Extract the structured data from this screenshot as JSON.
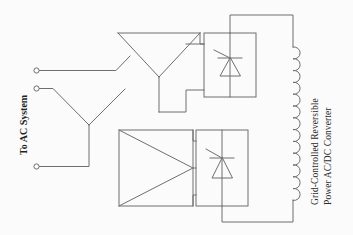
{
  "figure": {
    "background_color": "#fbfbfb",
    "line_color": "#6e6e6e",
    "text_color": "#2b2b2b"
  },
  "labels": {
    "ac_system": "To AC System",
    "converter_line1": "Grid-Controlled Reversible",
    "converter_line2": "Power AC/DC Converter"
  },
  "components": {
    "ac_terminals": [
      {
        "name": "ac-terminal-phase-a",
        "cx": 36.5,
        "cy": 70.5,
        "r": 2.6
      },
      {
        "name": "ac-terminal-phase-b",
        "cx": 36.5,
        "cy": 88.5,
        "r": 2.6
      },
      {
        "name": "ac-terminal-phase-c",
        "cx": 36.5,
        "cy": 166.5,
        "r": 2.6
      }
    ],
    "wye_source": {
      "name": "ac-wye-connection",
      "neutral_x": 89,
      "neutral_y": 125
    },
    "upper_transformer": {
      "name": "wye-winding-transformer",
      "type": "wye",
      "x": 118,
      "y": 33,
      "width": 82,
      "height": 55
    },
    "lower_transformer": {
      "name": "delta-winding-transformer",
      "type": "delta",
      "x": 119,
      "y": 130,
      "width": 74,
      "height": 76
    },
    "upper_converter": {
      "name": "upper-thyristor-bridge",
      "x": 204,
      "y": 33,
      "width": 52,
      "height": 64,
      "device": "thyristor"
    },
    "lower_converter": {
      "name": "lower-thyristor-bridge",
      "x": 196,
      "y": 130,
      "width": 52,
      "height": 76,
      "device": "thyristor"
    },
    "dc_reactor": {
      "name": "dc-smoothing-reactor",
      "x": 293,
      "y_top": 47,
      "y_bottom": 200,
      "turns": 13,
      "radius": 6
    }
  }
}
